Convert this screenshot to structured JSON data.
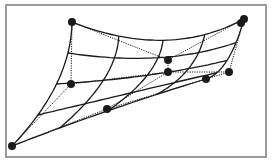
{
  "figure": {
    "frame": {
      "x": 6,
      "y": 5,
      "width": 260,
      "height": 152
    },
    "colors": {
      "line": "#1a1a1a",
      "frame": "#9a9a9a",
      "background": "#ffffff"
    },
    "control_points": [
      {
        "id": "p00",
        "x": 72,
        "y": 22
      },
      {
        "id": "p01",
        "x": 168,
        "y": 60
      },
      {
        "id": "p02",
        "x": 244,
        "y": 19
      },
      {
        "id": "p10",
        "x": 71,
        "y": 84
      },
      {
        "id": "p11",
        "x": 168,
        "y": 72
      },
      {
        "id": "p12",
        "x": 229,
        "y": 72
      },
      {
        "id": "p20",
        "x": 12,
        "y": 146
      },
      {
        "id": "p21",
        "x": 107,
        "y": 109
      },
      {
        "id": "p22",
        "x": 206,
        "y": 79
      }
    ],
    "extra_points": [
      {
        "id": "p02b",
        "x": 241,
        "y": 23
      }
    ],
    "mesh": {
      "u_lines": 5,
      "v_lines": 5
    }
  }
}
